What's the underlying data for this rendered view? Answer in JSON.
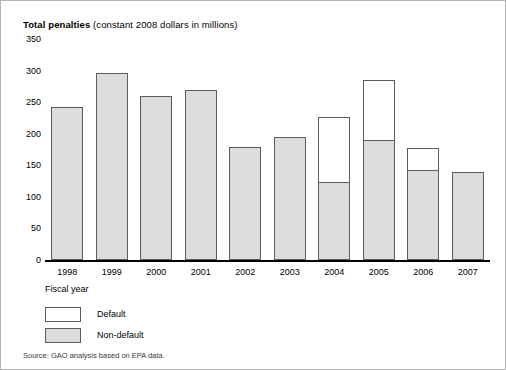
{
  "figure": {
    "title_bold": "Total penalties",
    "title_rest": " (constant 2008 dollars in millions)",
    "source": "Source: GAO analysis based on EPA data.",
    "xaxis_title": "Fiscal year",
    "border_color": "#b5b5b5"
  },
  "legend": {
    "position": "below-axis",
    "items": [
      {
        "label": "Default",
        "color": "#ffffff"
      },
      {
        "label": "Non-default",
        "color": "#dcdcdc"
      }
    ]
  },
  "chart_data": {
    "type": "bar",
    "title": "Total penalties (constant 2008 dollars in millions)",
    "xlabel": "Fiscal year",
    "ylabel": "",
    "ylim": [
      0,
      350
    ],
    "yticks": [
      0,
      50,
      100,
      150,
      200,
      250,
      300,
      350
    ],
    "ytick_labels": [
      "0",
      "50",
      "100",
      "150",
      "200",
      "250",
      "300",
      "350"
    ],
    "grid": false,
    "stacked": true,
    "categories": [
      "1998",
      "1999",
      "2000",
      "2001",
      "2002",
      "2003",
      "2004",
      "2005",
      "2006",
      "2007"
    ],
    "series": [
      {
        "name": "Non-default",
        "color": "#dcdcdc",
        "values": [
          241,
          294,
          258,
          267,
          178,
          193,
          122,
          189,
          141,
          138
        ]
      },
      {
        "name": "Default",
        "color": "#ffffff",
        "values": [
          0,
          0,
          0,
          0,
          0,
          0,
          103,
          95,
          35,
          0
        ]
      }
    ],
    "totals": [
      241,
      294,
      258,
      267,
      178,
      193,
      225,
      284,
      176,
      138
    ]
  }
}
